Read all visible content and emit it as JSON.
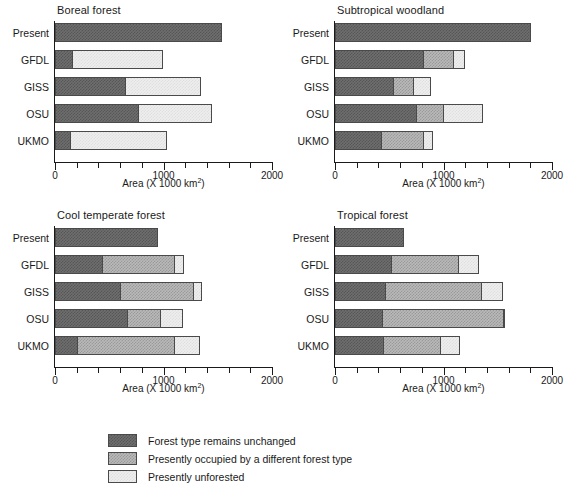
{
  "figure": {
    "axis_caption_prefix": "Area (X 1000 km",
    "axis_caption_sup": "2",
    "axis_caption_suffix": ")"
  },
  "legend": {
    "items": [
      {
        "key": "unchanged",
        "label": "Forest type remains unchanged",
        "color": "#6e6e6e"
      },
      {
        "key": "different",
        "label": "Presently occupied by a different forest type",
        "color": "#b9b9b9"
      },
      {
        "key": "unforested",
        "label": "Presently unforested",
        "color": "#eeeeee"
      }
    ]
  },
  "chart_data": [
    {
      "type": "bar",
      "orientation": "horizontal",
      "stacked": true,
      "title": "Boreal forest",
      "xlabel": "Area (X 1000 km2)",
      "ylabel": "",
      "xlim": [
        0,
        2000
      ],
      "xticks": [
        0,
        1000,
        2000
      ],
      "xtick_labels": [
        "0",
        "1000",
        "2000"
      ],
      "minor_tick_interval": 200,
      "grid": false,
      "legend_position": "figure-bottom",
      "categories": [
        "Present",
        "GFDL",
        "GISS",
        "OSU",
        "UKMO"
      ],
      "series": [
        {
          "name": "Forest type remains unchanged",
          "values": [
            1540,
            155,
            645,
            765,
            140
          ]
        },
        {
          "name": "Presently occupied by a different forest type",
          "values": [
            0,
            0,
            0,
            0,
            0
          ]
        },
        {
          "name": "Presently unforested",
          "values": [
            0,
            840,
            700,
            680,
            890
          ]
        }
      ],
      "totals": [
        1540,
        995,
        1345,
        1445,
        1030
      ]
    },
    {
      "type": "bar",
      "orientation": "horizontal",
      "stacked": true,
      "title": "Subtropical woodland",
      "xlabel": "Area (X 1000 km2)",
      "ylabel": "",
      "xlim": [
        0,
        2000
      ],
      "xticks": [
        0,
        1000,
        2000
      ],
      "xtick_labels": [
        "0",
        "1000",
        "2000"
      ],
      "minor_tick_interval": 200,
      "grid": false,
      "legend_position": "figure-bottom",
      "categories": [
        "Present",
        "GFDL",
        "GISS",
        "OSU",
        "UKMO"
      ],
      "series": [
        {
          "name": "Forest type remains unchanged",
          "values": [
            1810,
            810,
            530,
            745,
            420
          ]
        },
        {
          "name": "Presently occupied by a different forest type",
          "values": [
            0,
            275,
            185,
            255,
            390
          ]
        },
        {
          "name": "Presently unforested",
          "values": [
            0,
            115,
            170,
            360,
            90
          ]
        }
      ],
      "totals": [
        1810,
        1200,
        885,
        1360,
        900
      ]
    },
    {
      "type": "bar",
      "orientation": "horizontal",
      "stacked": true,
      "title": "Cool temperate forest",
      "xlabel": "Area (X 1000 km2)",
      "ylabel": "",
      "xlim": [
        0,
        2000
      ],
      "xticks": [
        0,
        1000,
        2000
      ],
      "xtick_labels": [
        "0",
        "1000",
        "2000"
      ],
      "minor_tick_interval": 200,
      "grid": false,
      "legend_position": "figure-bottom",
      "categories": [
        "Present",
        "GFDL",
        "GISS",
        "OSU",
        "UKMO"
      ],
      "series": [
        {
          "name": "Forest type remains unchanged",
          "values": [
            950,
            430,
            595,
            665,
            205
          ]
        },
        {
          "name": "Presently occupied by a different forest type",
          "values": [
            0,
            670,
            680,
            300,
            890
          ]
        },
        {
          "name": "Presently unforested",
          "values": [
            0,
            90,
            80,
            215,
            245
          ]
        }
      ],
      "totals": [
        950,
        1190,
        1355,
        1180,
        1340
      ]
    },
    {
      "type": "bar",
      "orientation": "horizontal",
      "stacked": true,
      "title": "Tropical forest",
      "xlabel": "Area (X 1000 km2)",
      "ylabel": "",
      "xlim": [
        0,
        2000
      ],
      "xticks": [
        0,
        1000,
        2000
      ],
      "xtick_labels": [
        "0",
        "1000",
        "2000"
      ],
      "minor_tick_interval": 200,
      "grid": false,
      "legend_position": "figure-bottom",
      "categories": [
        "Present",
        "GFDL",
        "GISS",
        "OSU",
        "UKMO"
      ],
      "series": [
        {
          "name": "Forest type remains unchanged",
          "values": [
            640,
            520,
            460,
            430,
            440
          ]
        },
        {
          "name": "Presently occupied by a different forest type",
          "values": [
            0,
            610,
            885,
            1115,
            530
          ]
        },
        {
          "name": "Presently unforested",
          "values": [
            0,
            200,
            200,
            25,
            185
          ]
        }
      ],
      "totals": [
        640,
        1330,
        1545,
        1570,
        1155
      ]
    }
  ]
}
